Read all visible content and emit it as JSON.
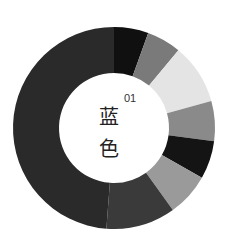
{
  "chart_data": {
    "type": "pie",
    "variant": "donut",
    "title": "",
    "center_label": {
      "number": "01",
      "text_line1": "蓝",
      "text_line2": "色"
    },
    "categories": [
      "s1",
      "s2",
      "s3",
      "s4",
      "s5",
      "s6",
      "s7",
      "s8"
    ],
    "values": [
      5.5,
      5.5,
      9.7,
      6.4,
      6.1,
      6.9,
      11.1,
      48.8
    ],
    "colors": [
      "#101010",
      "#7a7a7a",
      "#e4e4e4",
      "#8a8a8a",
      "#141414",
      "#9a9a9a",
      "#3a3a3a",
      "#2a2a2a"
    ],
    "legend": "none"
  }
}
